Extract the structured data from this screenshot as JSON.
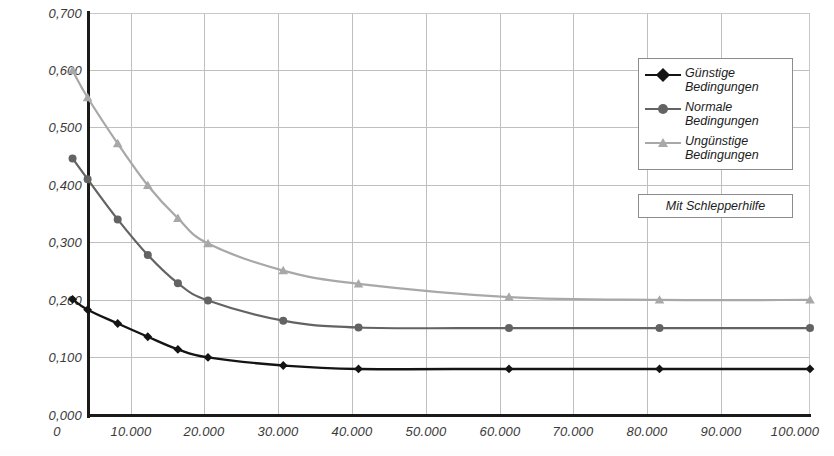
{
  "chart_data": {
    "type": "line",
    "title": "",
    "xlabel": "",
    "ylabel": "",
    "xlim": [
      0,
      100000
    ],
    "ylim": [
      0.0,
      0.7
    ],
    "grid": true,
    "legend_position": "top-right inside plot",
    "x_tick_labels": [
      "0",
      "10.000",
      "20.000",
      "30.000",
      "40.000",
      "50.000",
      "60.000",
      "70.000",
      "80.000",
      "90.000",
      "100.000"
    ],
    "x_ticks": [
      0,
      10000,
      20000,
      30000,
      40000,
      50000,
      60000,
      70000,
      80000,
      90000,
      100000
    ],
    "y_tick_labels": [
      "0,000",
      "0,100",
      "0,200",
      "0,300",
      "0,400",
      "0,500",
      "0,600",
      "0,700"
    ],
    "y_ticks": [
      0.0,
      0.1,
      0.2,
      0.3,
      0.4,
      0.5,
      0.6,
      0.7
    ],
    "decimal_separator": ",",
    "thousands_separator": ".",
    "series": [
      {
        "name": "Günstige Bedingungen",
        "color": "#141414",
        "marker": "diamond",
        "x": [
          2000,
          4000,
          8000,
          12000,
          16000,
          20000,
          30000,
          40000,
          60000,
          80000,
          100000
        ],
        "values": [
          0.202,
          0.184,
          0.16,
          0.137,
          0.115,
          0.101,
          0.087,
          0.081,
          0.081,
          0.081,
          0.081
        ]
      },
      {
        "name": "Normale Bedingungen",
        "color": "#636363",
        "marker": "circle",
        "x": [
          2000,
          4000,
          8000,
          12000,
          16000,
          20000,
          30000,
          40000,
          60000,
          80000,
          100000
        ],
        "values": [
          0.447,
          0.411,
          0.341,
          0.279,
          0.23,
          0.2,
          0.165,
          0.153,
          0.152,
          0.152,
          0.152
        ]
      },
      {
        "name": "Ungünstige Bedingungen",
        "color": "#a8a8a8",
        "marker": "triangle",
        "x": [
          2000,
          4000,
          8000,
          12000,
          16000,
          20000,
          30000,
          40000,
          60000,
          80000,
          100000
        ],
        "values": [
          0.6,
          0.553,
          0.473,
          0.4,
          0.343,
          0.299,
          0.252,
          0.229,
          0.206,
          0.201,
          0.201
        ]
      }
    ],
    "annotations": [
      {
        "text": "Mit Schlepperhilfe",
        "kind": "boxed-note"
      }
    ]
  },
  "legend": {
    "entries": [
      {
        "label": "Günstige\nBedingungen",
        "color": "#141414",
        "marker": "diamond"
      },
      {
        "label": "Normale\nBedingungen",
        "color": "#636363",
        "marker": "circle"
      },
      {
        "label": "Ungünstige\nBedingungen",
        "color": "#a8a8a8",
        "marker": "triangle"
      }
    ]
  },
  "note": {
    "text": "Mit Schlepperhilfe"
  },
  "colors": {
    "axis": "#1a1a1a",
    "grid": "#bfbfbf",
    "background": "#ffffff",
    "tick_text": "#3a3a3a",
    "series_1": "#141414",
    "series_2": "#636363",
    "series_3": "#a8a8a8"
  }
}
